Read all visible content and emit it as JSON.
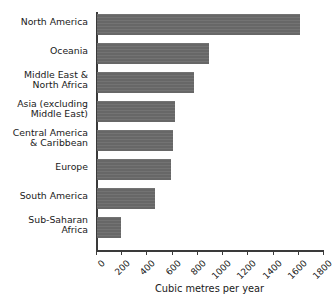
{
  "chart_data": {
    "type": "bar",
    "orientation": "horizontal",
    "title": "",
    "xlabel": "Cubic metres per year",
    "ylabel": "",
    "xlim": [
      0,
      1800
    ],
    "xticks": [
      0,
      200,
      400,
      600,
      800,
      1000,
      1200,
      1400,
      1600,
      1800
    ],
    "xtick_labels": [
      "0",
      "200",
      "400",
      "600",
      "800",
      "1000",
      "1200",
      "1400",
      "1600",
      "1800"
    ],
    "grid": false,
    "legend": null,
    "bar_color": "#6b6b6b",
    "axis_color": "#3a3a3a",
    "background": "#ffffff",
    "categories": [
      "North America",
      "Oceania",
      "Middle East &\nNorth Africa",
      "Asia (excluding\nMiddle East)",
      "Central America\n& Caribbean",
      "Europe",
      "South America",
      "Sub-Saharan\nAfrica"
    ],
    "values": [
      1610,
      890,
      770,
      620,
      600,
      590,
      460,
      190
    ]
  },
  "axis": {
    "x_title": "Cubic metres per year"
  }
}
